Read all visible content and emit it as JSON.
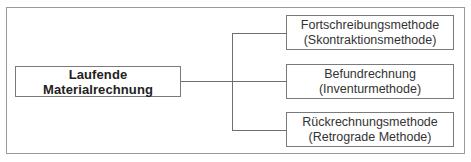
{
  "diagram": {
    "root": {
      "label": "Laufende Materialrechnung"
    },
    "children": [
      {
        "line1": "Fortschreibungsmethode",
        "line2": "(Skontraktionsmethode)"
      },
      {
        "line1": "Befundrechnung",
        "line2": "(Inventurmethode)"
      },
      {
        "line1": "Rückrechnungsmethode",
        "line2": "(Retrograde Methode)"
      }
    ]
  },
  "colors": {
    "frame_border": "#9a9a9a",
    "box_border": "#7a7a7a",
    "connector": "#6e6e6e",
    "text": "#222222"
  }
}
